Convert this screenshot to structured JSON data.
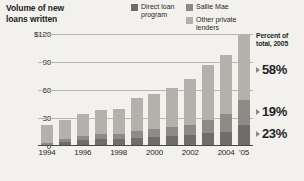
{
  "title": "Volume of new\nloans written",
  "legend": {
    "column_1": [
      {
        "label": "Direct loan\nprogram",
        "color": "#6f6c6a",
        "name": "direct-loan-program"
      }
    ],
    "column_2": [
      {
        "label": "Sallie Mae",
        "color": "#8e8b87",
        "name": "sallie-mae"
      },
      {
        "label": "Other private\nlenders",
        "color": "#b4b1ac",
        "name": "other-private-lenders"
      }
    ]
  },
  "percent_panel": {
    "header": "Percent of\ntotal, 2005",
    "rows": [
      {
        "value": "58%",
        "series": "Other private lenders"
      },
      {
        "value": "19%",
        "series": "Direct loan program"
      },
      {
        "value": "23%",
        "series": "Sallie Mae"
      }
    ]
  },
  "chart_data": {
    "type": "bar",
    "stacked": true,
    "title": "Volume of new loans written",
    "xlabel": "",
    "ylabel": "",
    "ylim": [
      0,
      120
    ],
    "yticks": [
      "0",
      "30",
      "60",
      "90",
      "$120"
    ],
    "ytick_values": [
      0,
      30,
      60,
      90,
      120
    ],
    "grid": true,
    "legend_position": "top-right",
    "categories": [
      "1994",
      "1995",
      "1996",
      "1997",
      "1998",
      "1999",
      "2000",
      "2001",
      "2002",
      "2003",
      "2004",
      "2005"
    ],
    "xtick_labels": [
      "1994",
      "1996",
      "1998",
      "2000",
      "2002",
      "2004",
      "'05"
    ],
    "series": [
      {
        "name": "Direct loan program",
        "color": "#6f6c6a",
        "values": [
          0,
          4,
          6,
          7,
          7,
          9,
          10,
          11,
          12,
          14,
          15,
          22
        ]
      },
      {
        "name": "Sallie Mae",
        "color": "#8e8b87",
        "values": [
          3,
          4,
          5,
          6,
          6,
          7,
          8,
          9,
          11,
          14,
          19,
          27
        ]
      },
      {
        "name": "Other private lenders",
        "color": "#b4b1ac",
        "values": [
          19,
          20,
          23,
          26,
          27,
          35,
          38,
          42,
          49,
          59,
          63,
          70
        ]
      }
    ],
    "totals": [
      22,
      28,
      34,
      39,
      40,
      51,
      56,
      62,
      72,
      87,
      97,
      119
    ],
    "annotations": [
      {
        "text": "58%",
        "series": "Other private lenders",
        "year": 2005
      },
      {
        "text": "19%",
        "series": "Direct loan program",
        "year": 2005
      },
      {
        "text": "23%",
        "series": "Sallie Mae",
        "year": 2005
      }
    ]
  }
}
